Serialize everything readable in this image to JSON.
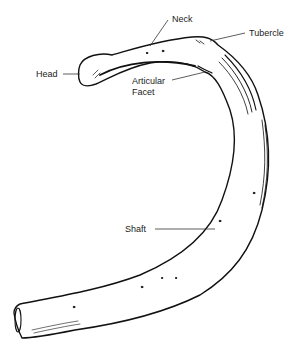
{
  "diagram": {
    "labels": [
      {
        "id": "neck",
        "text": "Neck"
      },
      {
        "id": "tubercle",
        "text": "Tubercle"
      },
      {
        "id": "head",
        "text": "Head"
      },
      {
        "id": "articular_facet",
        "text": "Articular Facet",
        "line1": "Articular",
        "line2": "Facet"
      },
      {
        "id": "shaft",
        "text": "Shaft"
      }
    ]
  },
  "colors": {
    "ink": "#111111",
    "background": "#ffffff"
  }
}
